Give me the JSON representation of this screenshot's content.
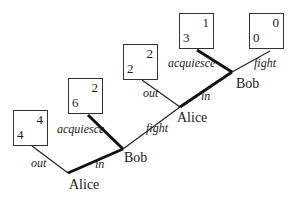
{
  "diagram": {
    "type": "extensive-form game tree",
    "players": [
      "Alice",
      "Bob"
    ],
    "nodes": [
      {
        "id": "alice1",
        "player": "Alice"
      },
      {
        "id": "bob1",
        "player": "Bob"
      },
      {
        "id": "alice2",
        "player": "Alice"
      },
      {
        "id": "bob2",
        "player": "Bob"
      }
    ],
    "edges": [
      {
        "from": "alice1",
        "label": "out"
      },
      {
        "from": "alice1",
        "label": "in"
      },
      {
        "from": "bob1",
        "label": "acquiesce"
      },
      {
        "from": "bob1",
        "label": "fight"
      },
      {
        "from": "alice2",
        "label": "out"
      },
      {
        "from": "alice2",
        "label": "in"
      },
      {
        "from": "bob2",
        "label": "acquiesce"
      },
      {
        "from": "bob2",
        "label": "fight"
      }
    ],
    "payoffs": [
      {
        "bottom_left": "4",
        "top_right": "4"
      },
      {
        "bottom_left": "6",
        "top_right": "2"
      },
      {
        "bottom_left": "2",
        "top_right": "2"
      },
      {
        "bottom_left": "3",
        "top_right": "1"
      },
      {
        "bottom_left": "0",
        "top_right": "0"
      }
    ]
  }
}
